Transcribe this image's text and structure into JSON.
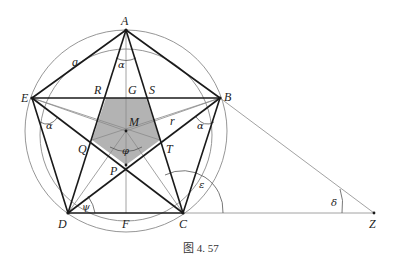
{
  "figure": {
    "caption": "图 4. 57",
    "points": {
      "A": "A",
      "B": "B",
      "C": "C",
      "D": "D",
      "E": "E",
      "F": "F",
      "G": "G",
      "M": "M",
      "P": "P",
      "Q": "Q",
      "R": "R",
      "S": "S",
      "T": "T",
      "Z": "Z"
    },
    "angles": {
      "alpha": "α",
      "phi": "φ",
      "psi": "ψ",
      "epsilon": "ε",
      "delta": "δ"
    },
    "segments": {
      "side": "a",
      "radius": "r"
    },
    "colors": {
      "thick_line": "#1a1a1a",
      "thin_line": "#8a8a8a",
      "shaded_pentagon": "#b3b3b3"
    }
  }
}
